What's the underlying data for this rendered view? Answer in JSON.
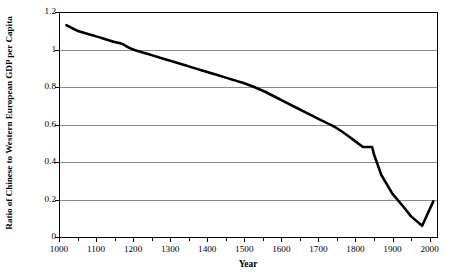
{
  "chart_data": {
    "type": "line",
    "title": "",
    "xlabel": "Year",
    "ylabel": "Ratio of Chinese to Western European GDP per Capita",
    "xlim": [
      1000,
      2020
    ],
    "ylim": [
      0,
      1.2
    ],
    "grid": true,
    "legend": "none",
    "line_color": "#000000",
    "line_width": 2.6,
    "x_major_ticks": [
      1000,
      1100,
      1200,
      1300,
      1400,
      1500,
      1600,
      1700,
      1800,
      1900,
      2000
    ],
    "x_minor_ticks": [
      1050,
      1150,
      1250,
      1350,
      1450,
      1550,
      1650,
      1750,
      1850,
      1950
    ],
    "x_tick_labels": [
      "1000",
      "1100",
      "1200",
      "1300",
      "1400",
      "1500",
      "1600",
      "1700",
      "1800",
      "1900",
      "2000"
    ],
    "y_ticks": [
      0,
      0.2,
      0.4,
      0.6,
      0.8,
      1,
      1.2
    ],
    "y_tick_labels": [
      "0",
      "0.2",
      "0.4",
      "0.6",
      "0.8",
      "1",
      "1.2"
    ],
    "series": [
      {
        "name": "Ratio of Chinese to Western European GDP per Capita",
        "x": [
          1020,
          1050,
          1100,
          1150,
          1170,
          1200,
          1250,
          1300,
          1350,
          1400,
          1450,
          1500,
          1550,
          1600,
          1650,
          1700,
          1750,
          1800,
          1820,
          1845,
          1850,
          1870,
          1900,
          1930,
          1950,
          1980,
          2010
        ],
        "values": [
          1.13,
          1.1,
          1.07,
          1.04,
          1.03,
          1.0,
          0.97,
          0.94,
          0.91,
          0.88,
          0.85,
          0.82,
          0.78,
          0.73,
          0.68,
          0.63,
          0.58,
          0.51,
          0.48,
          0.48,
          0.44,
          0.33,
          0.23,
          0.16,
          0.11,
          0.06,
          0.19
        ]
      }
    ],
    "annotations": []
  },
  "axes": {
    "x_title": "Year",
    "y_title": "Ratio of Chinese to Western European GDP per Capita"
  },
  "footer": {
    "cut_text": ""
  }
}
